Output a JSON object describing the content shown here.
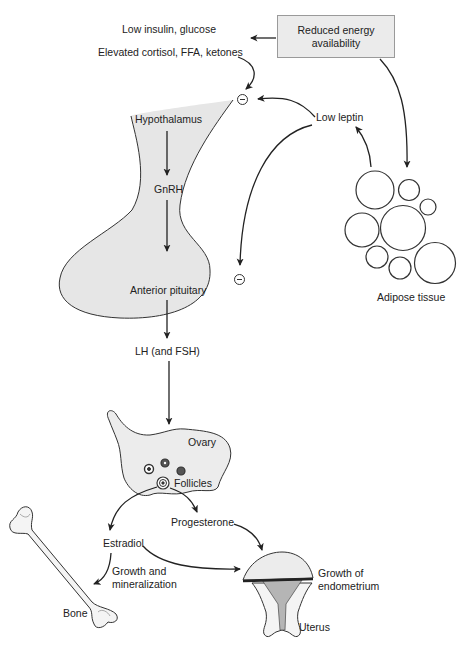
{
  "diagram": {
    "colors": {
      "tissue_fill": "#e6e6e6",
      "box_fill": "#ebebeb",
      "stroke": "#222222",
      "endometrium_fill": "#b5b5b5"
    },
    "nodes": {
      "energy_box": {
        "line1": "Reduced energy",
        "line2": "availability"
      },
      "low_insulin": "Low insulin, glucose",
      "elevated_cortisol": "Elevated cortisol, FFA, ketones",
      "low_leptin": "Low leptin",
      "hypothalamus": "Hypothalamus",
      "gnrh": "GnRH",
      "anterior_pituitary": "Anterior pituitary",
      "lh_fsh": "LH (and FSH)",
      "adipose": "Adipose tissue",
      "ovary": "Ovary",
      "follicles": "Follicles",
      "progesterone": "Progesterone",
      "estradiol": "Estradiol",
      "growth_mineral": {
        "line1": "Growth and",
        "line2": "mineralization"
      },
      "bone": "Bone",
      "growth_endo": {
        "line1": "Growth of",
        "line2": "endometrium"
      },
      "uterus": "Uterus"
    },
    "inhibition_symbols": [
      {
        "at": "hypothalamus",
        "symbol": "minus-circle"
      },
      {
        "at": "anterior_pituitary",
        "symbol": "minus-circle"
      }
    ],
    "edges": [
      {
        "from": "energy_box",
        "to": "low_insulin"
      },
      {
        "from": "elevated_cortisol",
        "to": "hypothalamus",
        "type": "inhibit"
      },
      {
        "from": "low_leptin",
        "to": "hypothalamus",
        "type": "inhibit"
      },
      {
        "from": "low_leptin",
        "to": "anterior_pituitary",
        "type": "inhibit"
      },
      {
        "from": "energy_box",
        "to": "adipose"
      },
      {
        "from": "adipose",
        "to": "low_leptin"
      },
      {
        "from": "hypothalamus",
        "to": "gnrh"
      },
      {
        "from": "gnrh",
        "to": "anterior_pituitary"
      },
      {
        "from": "anterior_pituitary",
        "to": "lh_fsh"
      },
      {
        "from": "lh_fsh",
        "to": "ovary"
      },
      {
        "from": "follicles",
        "to": "estradiol"
      },
      {
        "from": "follicles",
        "to": "progesterone"
      },
      {
        "from": "estradiol",
        "to": "bone"
      },
      {
        "from": "estradiol",
        "to": "uterus"
      },
      {
        "from": "progesterone",
        "to": "uterus"
      }
    ]
  }
}
